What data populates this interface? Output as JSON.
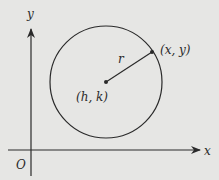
{
  "diagram": {
    "background": "#e6e6e4",
    "stroke_color": "#2a2a2a",
    "axes": {
      "x_label": "x",
      "y_label": "y",
      "origin_label": "O"
    },
    "circle": {
      "center_label": "(h, k)",
      "point_label": "(x, y)",
      "radius_label": "r"
    }
  }
}
